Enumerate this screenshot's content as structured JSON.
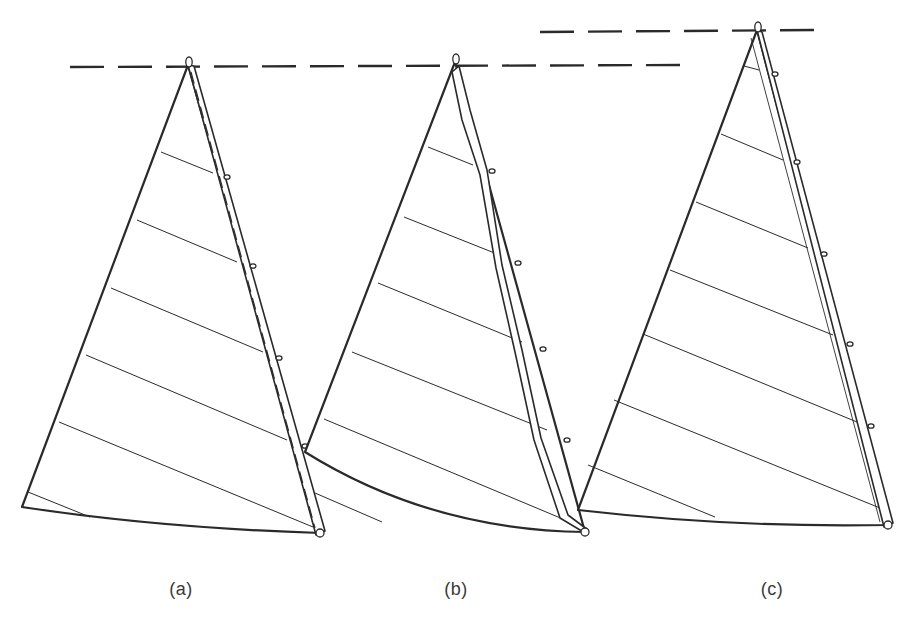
{
  "figure": {
    "background": "#ffffff",
    "ink_color": "#2a2a2a",
    "panels": [
      {
        "id": "a",
        "label": "(a)",
        "label_pos": [
          181,
          593
        ],
        "head": [
          188,
          65
        ],
        "tack": [
          22,
          507
        ],
        "clew": [
          320,
          533
        ],
        "foot_ctrl": [
          160,
          528
        ],
        "luff_style": "straight",
        "luff_strip": [
          [
            188,
            65
          ],
          [
            194,
            66
          ],
          [
            325,
            531
          ],
          [
            316,
            535
          ]
        ],
        "inner_dashed": [
          [
            191,
            72
          ],
          [
            315,
            528
          ]
        ],
        "seams": [
          [
            [
              161,
              152
            ],
            [
              213,
              173
            ]
          ],
          [
            [
              137,
              220
            ],
            [
              237,
              262
            ]
          ],
          [
            [
              111,
              288
            ],
            [
              263,
              352
            ]
          ],
          [
            [
              86,
              355
            ],
            [
              287,
              440
            ]
          ],
          [
            [
              59,
              422
            ],
            [
              313,
              527
            ]
          ],
          [
            [
              28,
              492
            ],
            [
              90,
              517
            ]
          ]
        ],
        "rings": [
          [
            227,
            177
          ],
          [
            253,
            266
          ],
          [
            279,
            358
          ],
          [
            305,
            446
          ]
        ]
      },
      {
        "id": "b",
        "label": "(b)",
        "label_pos": [
          456,
          593
        ],
        "head": [
          455,
          62
        ],
        "tack": [
          305,
          452
        ],
        "clew": [
          585,
          532
        ],
        "foot_ctrl": [
          430,
          530
        ],
        "luff_style": "bent",
        "luff_outer": [
          [
            459,
            66
          ],
          [
            470,
            110
          ],
          [
            487,
            170
          ],
          [
            502,
            265
          ],
          [
            522,
            350
          ],
          [
            541,
            438
          ],
          [
            568,
            515
          ],
          [
            588,
            530
          ]
        ],
        "luff_inner": [
          [
            452,
            72
          ],
          [
            462,
            120
          ],
          [
            480,
            175
          ],
          [
            496,
            268
          ],
          [
            515,
            352
          ],
          [
            534,
            440
          ],
          [
            560,
            518
          ],
          [
            580,
            530
          ]
        ],
        "seams": [
          [
            [
              428,
              147
            ],
            [
              473,
              165
            ]
          ],
          [
            [
              404,
              217
            ],
            [
              497,
              254
            ]
          ],
          [
            [
              378,
              283
            ],
            [
              522,
              342
            ]
          ],
          [
            [
              352,
              352
            ],
            [
              547,
              430
            ]
          ],
          [
            [
              324,
              419
            ],
            [
              570,
              522
            ]
          ],
          [
            [
              315,
              493
            ],
            [
              382,
              522
            ]
          ]
        ],
        "rings": [
          [
            492,
            171
          ],
          [
            518,
            263
          ],
          [
            543,
            349
          ],
          [
            567,
            440
          ]
        ]
      },
      {
        "id": "c",
        "label": "(c)",
        "label_pos": [
          772,
          593
        ],
        "head": [
          757,
          30
        ],
        "tack": [
          578,
          510
        ],
        "clew": [
          888,
          525
        ],
        "foot_ctrl": [
          735,
          528
        ],
        "luff_style": "straight",
        "luff_strip": [
          [
            757,
            30
          ],
          [
            762,
            32
          ],
          [
            893,
            523
          ],
          [
            884,
            527
          ]
        ],
        "inner_line": [
          [
            751,
            38
          ],
          [
            880,
            522
          ]
        ],
        "seams": [
          [
            [
              744,
              66
            ],
            [
              759,
              70
            ]
          ],
          [
            [
              721,
              134
            ],
            [
              783,
              160
            ]
          ],
          [
            [
              696,
              202
            ],
            [
              808,
              248
            ]
          ],
          [
            [
              670,
              270
            ],
            [
              833,
              335
            ]
          ],
          [
            [
              643,
              334
            ],
            [
              857,
              422
            ]
          ],
          [
            [
              614,
              400
            ],
            [
              880,
              508
            ]
          ],
          [
            [
              588,
              465
            ],
            [
              715,
              517
            ]
          ]
        ],
        "rings": [
          [
            775,
            74
          ],
          [
            797,
            162
          ],
          [
            824,
            254
          ],
          [
            850,
            344
          ],
          [
            871,
            426
          ]
        ]
      }
    ],
    "reference_lines": [
      {
        "from": [
          70,
          67
        ],
        "to": [
          685,
          65
        ],
        "style": "dashed"
      },
      {
        "from": [
          540,
          32
        ],
        "to": [
          823,
          30
        ],
        "style": "dashed"
      }
    ]
  }
}
